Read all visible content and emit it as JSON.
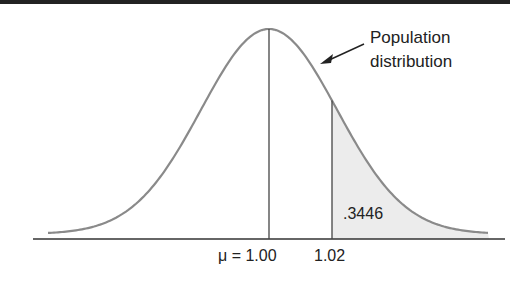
{
  "chart_data": {
    "type": "area",
    "title": "",
    "mean": 1.0,
    "x_ticks": [
      "μ = 1.00",
      "1.02"
    ],
    "shaded_region": {
      "from": 1.02,
      "to": "+inf",
      "area": 0.3446,
      "label": ".3446"
    },
    "annotations": [
      {
        "text": "Population distribution",
        "arrow_to": "curve"
      }
    ],
    "grid": false,
    "legend": null
  },
  "labels": {
    "annotation_line1": "Population",
    "annotation_line2": "distribution",
    "area_label": ".3446",
    "tick_mean": "μ = 1.00",
    "tick_value": "1.02"
  },
  "colors": {
    "curve": "#8a8a8a",
    "shade": "#ececec",
    "axis": "#333333",
    "rule": "#222222"
  }
}
